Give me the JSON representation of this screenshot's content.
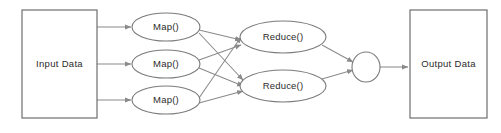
{
  "diagram": {
    "background_color": "#ffffff",
    "stroke_color": "#7b7b7b",
    "text_color": "#2b2b2b",
    "input": {
      "label": "Input Data",
      "shape": "rectangle",
      "x": 22,
      "y": 10,
      "width": 75,
      "height": 108
    },
    "mappers": [
      {
        "label": "Map()",
        "shape": "ellipse",
        "cx": 166,
        "cy": 27,
        "rx": 34,
        "ry": 14
      },
      {
        "label": "Map()",
        "shape": "ellipse",
        "cx": 166,
        "cy": 64,
        "rx": 34,
        "ry": 14
      },
      {
        "label": "Map()",
        "shape": "ellipse",
        "cx": 166,
        "cy": 100,
        "rx": 34,
        "ry": 14
      }
    ],
    "reducers": [
      {
        "label": "Reduce()",
        "shape": "ellipse",
        "cx": 283,
        "cy": 37,
        "rx": 43,
        "ry": 16
      },
      {
        "label": "Reduce()",
        "shape": "ellipse",
        "cx": 283,
        "cy": 86,
        "rx": 43,
        "ry": 16
      }
    ],
    "merge": {
      "label": "",
      "shape": "ellipse",
      "cx": 366,
      "cy": 67,
      "rx": 14,
      "ry": 15
    },
    "output": {
      "label": "Output Data",
      "shape": "rectangle",
      "x": 410,
      "y": 10,
      "width": 77,
      "height": 108
    },
    "edges": [
      {
        "from": "input",
        "to": "map-1",
        "x1": 97,
        "y1": 27,
        "x2": 131,
        "y2": 27
      },
      {
        "from": "input",
        "to": "map-2",
        "x1": 97,
        "y1": 64,
        "x2": 131,
        "y2": 64
      },
      {
        "from": "input",
        "to": "map-3",
        "x1": 97,
        "y1": 100,
        "x2": 131,
        "y2": 100
      },
      {
        "from": "map-1",
        "to": "reduce-1",
        "x1": 199,
        "y1": 30,
        "x2": 241,
        "y2": 40
      },
      {
        "from": "map-1",
        "to": "reduce-2",
        "x1": 199,
        "y1": 33,
        "x2": 243,
        "y2": 80
      },
      {
        "from": "map-2",
        "to": "reduce-1",
        "x1": 199,
        "y1": 60,
        "x2": 241,
        "y2": 45
      },
      {
        "from": "map-2",
        "to": "reduce-2",
        "x1": 199,
        "y1": 68,
        "x2": 243,
        "y2": 86
      },
      {
        "from": "map-3",
        "to": "reduce-1",
        "x1": 199,
        "y1": 98,
        "x2": 241,
        "y2": 37
      },
      {
        "from": "map-3",
        "to": "reduce-2",
        "x1": 199,
        "y1": 103,
        "x2": 243,
        "y2": 91
      },
      {
        "from": "reduce-1",
        "to": "merge",
        "x1": 322,
        "y1": 45,
        "x2": 353,
        "y2": 62
      },
      {
        "from": "reduce-2",
        "to": "merge",
        "x1": 322,
        "y1": 79,
        "x2": 353,
        "y2": 70
      },
      {
        "from": "merge",
        "to": "output",
        "x1": 380,
        "y1": 67,
        "x2": 408,
        "y2": 67
      }
    ]
  }
}
